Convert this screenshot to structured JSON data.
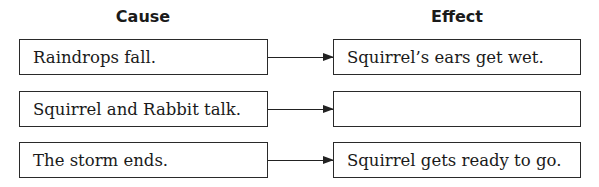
{
  "headers": {
    "cause": "Cause",
    "effect": "Effect"
  },
  "rows": [
    {
      "cause": "Raindrops fall.",
      "effect": "Squirrel’s ears get wet."
    },
    {
      "cause": "Squirrel and Rabbit talk.",
      "effect": ""
    },
    {
      "cause": "The storm ends.",
      "effect": "Squirrel gets ready to go."
    }
  ],
  "colors": {
    "line": "#222222",
    "text": "#1a1a1a",
    "background": "#ffffff"
  }
}
